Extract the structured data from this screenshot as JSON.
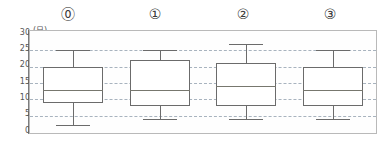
{
  "chart_data": {
    "type": "box",
    "title": "",
    "xlabel": "",
    "ylabel": "",
    "unit_label": "(日)",
    "ylim": [
      0,
      30
    ],
    "y_ticks": [
      0,
      5,
      10,
      15,
      20,
      25,
      30
    ],
    "y_tick_labels": [
      "0",
      "5",
      "10",
      "15",
      "20",
      "25",
      "30"
    ],
    "gridlines": [
      5,
      10,
      15,
      20,
      25
    ],
    "grid": true,
    "grid_style": "dashed",
    "legend": "none",
    "categories": [
      "⓪",
      "①",
      "②",
      "③"
    ],
    "boxes": [
      {
        "label": "⓪",
        "min": 2,
        "q1": 9,
        "median": 13,
        "q3": 20,
        "max": 25
      },
      {
        "label": "①",
        "min": 4,
        "q1": 8,
        "median": 13,
        "q3": 22,
        "max": 25
      },
      {
        "label": "②",
        "min": 4,
        "q1": 8,
        "median": 14,
        "q3": 21,
        "max": 27
      },
      {
        "label": "③",
        "min": 4,
        "q1": 8,
        "median": 13,
        "q3": 20,
        "max": 25
      }
    ],
    "colors": {
      "box_stroke": "#6b6b6b",
      "median_stroke": "#77776e",
      "whisker_stroke": "#6b6b6b",
      "grid": "#9aa7b4",
      "frame": "#b9b9b9",
      "axis": "#7d7d7d",
      "background": "#ffffff",
      "label_text": "#3a3a3a",
      "tick_text": "#555555"
    }
  },
  "axis": {
    "tick_0": "0",
    "tick_5": "5",
    "tick_10": "10",
    "tick_15": "15",
    "tick_20": "20",
    "tick_25": "25",
    "tick_30": "30",
    "unit": "(日)"
  },
  "groups": {
    "g0": "⓪",
    "g1": "①",
    "g2": "②",
    "g3": "③"
  }
}
